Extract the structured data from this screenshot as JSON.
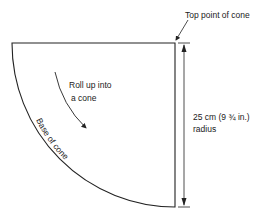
{
  "diagram": {
    "labels": {
      "top_point": "Top point of cone",
      "roll_up_line1": "Roll up into",
      "roll_up_line2": "a cone",
      "base": "Base of cone",
      "dimension_line1": "25 cm (9 ¾ in.)",
      "dimension_line2": "radius"
    },
    "colors": {
      "stroke": "#222222",
      "background": "#ffffff"
    }
  }
}
